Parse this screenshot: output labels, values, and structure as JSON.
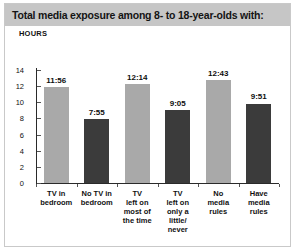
{
  "figure": {
    "title": "Total media exposure among 8- to 18-year-olds with:",
    "axis_unit_label": "HOURS"
  },
  "colors": {
    "title_band": "#c6c6c6",
    "bar_light": "#a9a9a9",
    "bar_dark": "#3b3b3b",
    "frame": "#c9c9c9",
    "axis": "#2a2a2a",
    "text": "#111111"
  },
  "chart_data": {
    "type": "bar",
    "title": "Total media exposure among 8- to 18-year-olds with:",
    "xlabel": "",
    "ylabel": "HOURS",
    "ylim": [
      0,
      14
    ],
    "yticks": [
      0,
      2,
      4,
      6,
      8,
      10,
      12,
      14
    ],
    "ytick_labels": [
      "0",
      "2",
      "4",
      "6",
      "8",
      "10",
      "12",
      "14"
    ],
    "grid": false,
    "legend": "none",
    "categories": [
      "TV in\nbedroom",
      "No TV in\nbedroom",
      "TV\nleft on\nmost of\nthe time",
      "TV\nleft on\nonly a\nlittle/\nnever",
      "No\nmedia\nrules",
      "Have\nmedia\nrules"
    ],
    "value_labels": [
      "11:56",
      "7:55",
      "12:14",
      "9:05",
      "12:43",
      "9:51"
    ],
    "values": [
      11.933,
      7.917,
      12.233,
      9.083,
      12.717,
      9.85
    ],
    "bar_colors": [
      "#a9a9a9",
      "#3b3b3b",
      "#a9a9a9",
      "#3b3b3b",
      "#a9a9a9",
      "#3b3b3b"
    ]
  }
}
